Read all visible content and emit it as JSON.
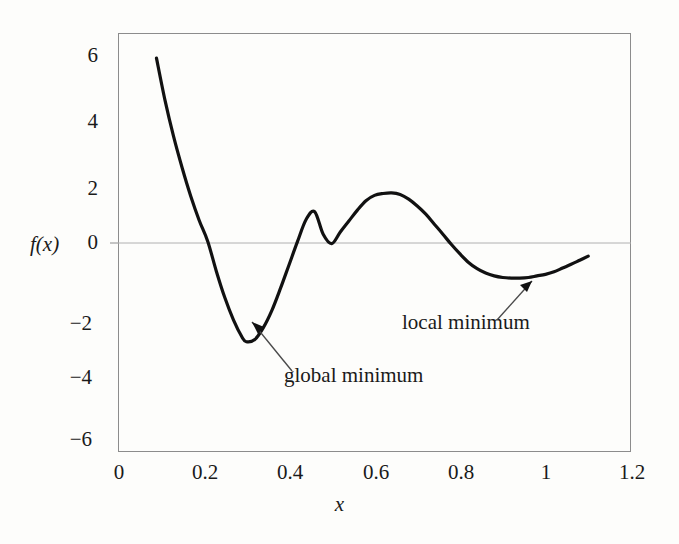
{
  "figure": {
    "background_color": "#fdfdfb",
    "frame_color": "#8c8c8c",
    "curve_color": "#111111"
  },
  "axes": {
    "ylabel": "f(x)",
    "xlabel": "x",
    "yticks": [
      "6",
      "4",
      "2",
      "0",
      "−2",
      "−4",
      "−6"
    ],
    "xticks": [
      "0",
      "0.2",
      "0.4",
      "0.6",
      "0.8",
      "1",
      "1.2"
    ]
  },
  "annotations": {
    "global": "global minimum",
    "local": "local minimum"
  },
  "chart_data": {
    "type": "line",
    "title": "",
    "xlabel": "x",
    "ylabel": "f(x)",
    "xlim": [
      0,
      1.2
    ],
    "ylim": [
      -6.7,
      6.7
    ],
    "xticks": [
      0,
      0.2,
      0.4,
      0.6,
      0.8,
      1,
      1.2
    ],
    "yticks": [
      6,
      4,
      2,
      0,
      -2,
      -4,
      -6
    ],
    "grid": false,
    "legend": null,
    "zero_line": true,
    "series": [
      {
        "name": "f(x)",
        "color": "#111111",
        "linewidth": 3.2,
        "x": [
          0.09,
          0.11,
          0.13,
          0.15,
          0.17,
          0.19,
          0.21,
          0.23,
          0.25,
          0.27,
          0.29,
          0.3,
          0.32,
          0.34,
          0.36,
          0.38,
          0.4,
          0.42,
          0.44,
          0.46,
          0.48,
          0.5,
          0.52,
          0.54,
          0.56,
          0.58,
          0.6,
          0.62,
          0.64,
          0.66,
          0.68,
          0.7,
          0.72,
          0.74,
          0.76,
          0.78,
          0.8,
          0.82,
          0.84,
          0.86,
          0.88,
          0.9,
          0.92,
          0.94,
          0.96,
          0.98,
          1.0,
          1.02,
          1.04,
          1.06,
          1.08,
          1.1
        ],
        "y": [
          5.9,
          4.55,
          3.4,
          2.4,
          1.5,
          0.72,
          0.05,
          -0.9,
          -1.75,
          -2.45,
          -3.0,
          -3.15,
          -3.08,
          -2.7,
          -2.15,
          -1.45,
          -0.7,
          0.05,
          0.75,
          1.0,
          0.28,
          -0.02,
          0.35,
          0.7,
          1.05,
          1.35,
          1.52,
          1.58,
          1.6,
          1.55,
          1.4,
          1.18,
          0.92,
          0.6,
          0.28,
          -0.05,
          -0.35,
          -0.62,
          -0.82,
          -0.96,
          -1.05,
          -1.1,
          -1.12,
          -1.12,
          -1.1,
          -1.05,
          -1.0,
          -0.92,
          -0.8,
          -0.68,
          -0.55,
          -0.42
        ]
      }
    ],
    "markers": [
      {
        "label": "global minimum",
        "x": 0.295,
        "y": -3.12
      },
      {
        "label": "local minimum",
        "x": 0.965,
        "y": -1.08
      },
      {
        "label": "local maximum",
        "x": 0.64,
        "y": 1.6
      }
    ],
    "annotations": [
      {
        "text": "global minimum",
        "target_x": 0.295,
        "target_y": -3.12,
        "text_x": 0.39,
        "text_y": -4.0
      },
      {
        "text": "local minimum",
        "target_x": 0.965,
        "target_y": -1.08,
        "text_x": 0.73,
        "text_y": -2.3
      }
    ]
  }
}
